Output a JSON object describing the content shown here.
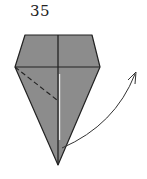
{
  "diagram": {
    "type": "origami-step",
    "step_number": "35",
    "colors": {
      "paper": "#8c8c8c",
      "line": "#222222",
      "arrow": "#333333",
      "gap": "#e8e8e8"
    },
    "elements": {
      "crease": "valley-fold (dashed)",
      "arrow": "fold/lift direction arrow"
    }
  }
}
